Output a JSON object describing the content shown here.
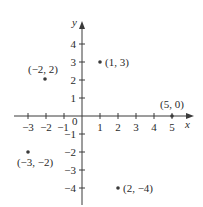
{
  "figure": {
    "type": "coordinate-plane",
    "axes": {
      "x_label": "x",
      "y_label": "y",
      "origin_label": "0",
      "x_ticks": [
        {
          "value": -3,
          "label": "−3"
        },
        {
          "value": -2,
          "label": "−2"
        },
        {
          "value": -1,
          "label": "−1"
        },
        {
          "value": 1,
          "label": "1"
        },
        {
          "value": 2,
          "label": "2"
        },
        {
          "value": 3,
          "label": "3"
        },
        {
          "value": 4,
          "label": "4"
        },
        {
          "value": 5,
          "label": "5"
        }
      ],
      "y_ticks": [
        {
          "value": 4,
          "label": "4"
        },
        {
          "value": 3,
          "label": "3"
        },
        {
          "value": 2,
          "label": "2"
        },
        {
          "value": 1,
          "label": "1"
        },
        {
          "value": -1,
          "label": "−1"
        },
        {
          "value": -2,
          "label": "−2"
        },
        {
          "value": -3,
          "label": "−3"
        },
        {
          "value": -4,
          "label": "−4"
        }
      ]
    },
    "points": [
      {
        "x": 1,
        "y": 3,
        "label": "(1, 3)"
      },
      {
        "x": -2,
        "y": 2,
        "label": "(−2, 2)"
      },
      {
        "x": 5,
        "y": 0,
        "label": "(5, 0)"
      },
      {
        "x": -3,
        "y": -2,
        "label": "(−3, −2)"
      },
      {
        "x": 2,
        "y": -4,
        "label": "(2, −4)"
      }
    ],
    "colors": {
      "axis": "#3a3a3a",
      "point": "#3a3a3a",
      "text": "#2a2a2a"
    }
  }
}
